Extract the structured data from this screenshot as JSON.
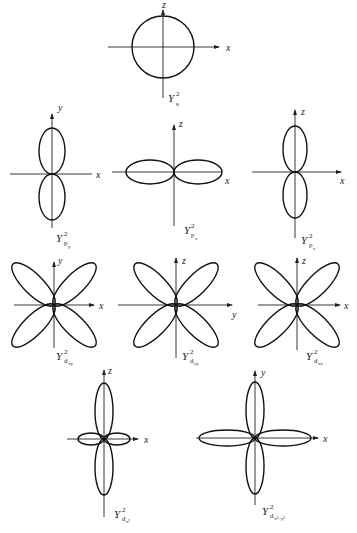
{
  "diagrams": [
    {
      "id": "s",
      "label_main": "Y",
      "label_sup": "2",
      "label_sub": "s",
      "label_subsub": "",
      "axis_h": "x",
      "axis_v": "z",
      "shape": "circle"
    },
    {
      "id": "py",
      "label_main": "Y",
      "label_sup": "2",
      "label_sub": "p",
      "label_subsub": "y",
      "axis_h": "x",
      "axis_v": "y",
      "shape": "two-lobes-vertical"
    },
    {
      "id": "px",
      "label_main": "Y",
      "label_sup": "2",
      "label_sub": "p",
      "label_subsub": "x",
      "axis_h": "x",
      "axis_v": "z",
      "shape": "two-lobes-horizontal"
    },
    {
      "id": "pz",
      "label_main": "Y",
      "label_sup": "2",
      "label_sub": "p",
      "label_subsub": "z",
      "axis_h": "x",
      "axis_v": "z",
      "shape": "two-lobes-vertical"
    },
    {
      "id": "dxy",
      "label_main": "Y",
      "label_sup": "2",
      "label_sub": "d",
      "label_subsub": "xy",
      "axis_h": "x",
      "axis_v": "y",
      "shape": "four-lobes-diagonal"
    },
    {
      "id": "dzy",
      "label_main": "Y",
      "label_sup": "2",
      "label_sub": "d",
      "label_subsub": "zy",
      "axis_h": "y",
      "axis_v": "z",
      "shape": "four-lobes-diagonal"
    },
    {
      "id": "dxz",
      "label_main": "Y",
      "label_sup": "2",
      "label_sub": "d",
      "label_subsub": "xz",
      "axis_h": "x",
      "axis_v": "z",
      "shape": "four-lobes-diagonal"
    },
    {
      "id": "dz2",
      "label_main": "Y",
      "label_sup": "2",
      "label_sub": "d",
      "label_subsub": "z²",
      "axis_h": "x",
      "axis_v": "z",
      "shape": "two-long-vertical-two-short-horizontal"
    },
    {
      "id": "dx2y2",
      "label_main": "Y",
      "label_sup": "2",
      "label_sub": "d",
      "label_subsub": "x²−y²",
      "axis_h": "x",
      "axis_v": "y",
      "shape": "four-lobes-axial"
    }
  ]
}
